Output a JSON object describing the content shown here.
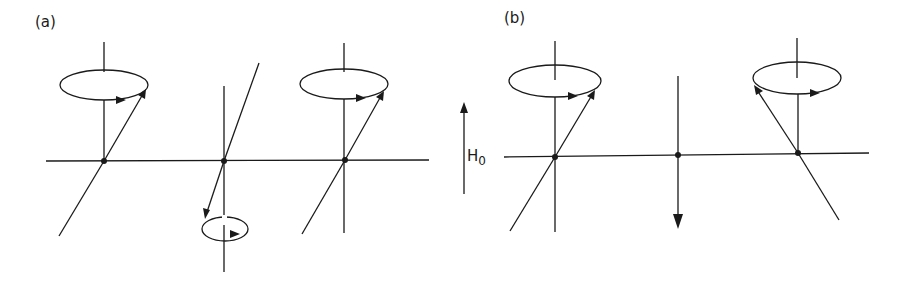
{
  "figure": {
    "type": "spin precession diagram",
    "panels": [
      {
        "label": "(a)",
        "description": "Three precessing spins on a horizontal lattice; outer spins precess upward, middle spin precesses downward",
        "spins": [
          {
            "position": "left",
            "orientation": "up",
            "precession": "counterclockwise-arrow"
          },
          {
            "position": "middle",
            "orientation": "down",
            "precession": "small cone below"
          },
          {
            "position": "right",
            "orientation": "up",
            "precession": "counterclockwise-arrow"
          }
        ]
      },
      {
        "label": "(b)",
        "description": "Outer spins precess upward with opposite tilt; middle spin points straight down",
        "spins": [
          {
            "position": "left",
            "orientation": "up",
            "precession": "cone with arrow"
          },
          {
            "position": "middle",
            "orientation": "down",
            "precession": "none"
          },
          {
            "position": "right",
            "orientation": "up",
            "precession": "cone with arrow, tilted left"
          }
        ]
      }
    ],
    "field": {
      "label": "H",
      "subscript": "0",
      "direction": "up"
    }
  }
}
